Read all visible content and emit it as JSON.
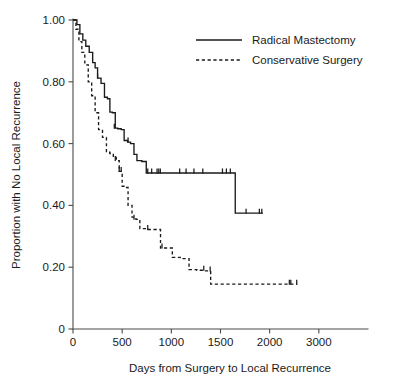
{
  "chart_data": {
    "type": "line",
    "subtype": "kaplan-meier-step",
    "title": "",
    "xlabel": "Days from Surgery to Local Recurrence",
    "ylabel": "Proportion with No Local Recurrence",
    "xlim": [
      0,
      3000
    ],
    "ylim": [
      0,
      1.0
    ],
    "grid": false,
    "legend_position": "top-right",
    "x_tick_labels": [
      "0",
      "500",
      "1000",
      "1500",
      "2000",
      "3000"
    ],
    "x_tick_values": [
      0,
      500,
      1000,
      1500,
      2000,
      2500
    ],
    "y_tick_labels": [
      "0",
      "0.20",
      "0.40",
      "0.60",
      "0.80",
      "1.00"
    ],
    "y_tick_values": [
      0,
      0.2,
      0.4,
      0.6,
      0.8,
      1.0
    ],
    "series": [
      {
        "name": "Radical Mastectomy",
        "style": "solid",
        "color": "#1a1a1a",
        "steps_x": [
          0,
          40,
          70,
          100,
          130,
          165,
          200,
          225,
          250,
          285,
          320,
          350,
          375,
          400,
          430,
          455,
          490,
          520,
          555,
          585,
          620,
          650,
          700,
          745,
          1650,
          1930
        ],
        "steps_y": [
          1.0,
          0.985,
          0.955,
          0.935,
          0.915,
          0.895,
          0.862,
          0.845,
          0.812,
          0.795,
          0.75,
          0.745,
          0.702,
          0.7,
          0.65,
          0.648,
          0.645,
          0.61,
          0.605,
          0.6,
          0.565,
          0.545,
          0.542,
          0.505,
          0.375,
          0.375
        ],
        "censor_x": [
          250,
          420,
          560,
          760,
          800,
          855,
          872,
          888,
          1085,
          1150,
          1230,
          1320,
          1520,
          1560,
          1600,
          1760,
          1895,
          1920
        ],
        "censor_y": [
          0.812,
          0.65,
          0.605,
          0.505,
          0.505,
          0.505,
          0.505,
          0.505,
          0.505,
          0.505,
          0.505,
          0.505,
          0.505,
          0.505,
          0.505,
          0.375,
          0.375,
          0.375
        ]
      },
      {
        "name": "Conservative Surgery",
        "style": "dashed",
        "color": "#1a1a1a",
        "steps_x": [
          0,
          30,
          60,
          90,
          120,
          155,
          190,
          225,
          260,
          300,
          340,
          375,
          410,
          440,
          470,
          500,
          530,
          560,
          600,
          640,
          680,
          760,
          890,
          920,
          1010,
          1090,
          1180,
          1260,
          1340,
          1400,
          2280
        ],
        "steps_y": [
          1.0,
          0.97,
          0.93,
          0.895,
          0.855,
          0.8,
          0.755,
          0.7,
          0.645,
          0.62,
          0.572,
          0.568,
          0.555,
          0.545,
          0.51,
          0.462,
          0.458,
          0.4,
          0.362,
          0.355,
          0.325,
          0.322,
          0.262,
          0.262,
          0.232,
          0.228,
          0.192,
          0.19,
          0.188,
          0.145,
          0.145
        ],
        "censor_x": [
          430,
          470,
          490,
          620,
          760,
          905,
          1330,
          1395,
          2200,
          2215,
          2275
        ],
        "censor_y": [
          0.545,
          0.51,
          0.51,
          0.355,
          0.322,
          0.262,
          0.19,
          0.188,
          0.145,
          0.145,
          0.145
        ]
      }
    ]
  },
  "legend": {
    "entries": [
      {
        "label": "Radical Mastectomy",
        "style": "solid"
      },
      {
        "label": "Conservative Surgery",
        "style": "dashed"
      }
    ]
  }
}
